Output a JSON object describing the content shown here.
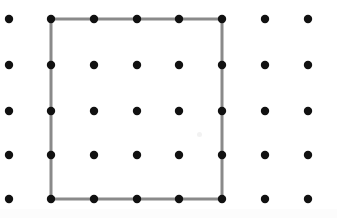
{
  "canvas": {
    "width": 337,
    "height": 218,
    "background": "#ffffff"
  },
  "grid": {
    "rows": 5,
    "columns": 8,
    "dot_color": "#111111",
    "dot_radius": 4.2,
    "column_x": [
      9,
      51,
      94,
      137,
      179,
      222,
      265,
      308
    ],
    "row_y": [
      19,
      65,
      111,
      155,
      199
    ],
    "points": [
      {
        "row": 0,
        "col": 0,
        "x": 9,
        "y": 19
      },
      {
        "row": 0,
        "col": 1,
        "x": 51,
        "y": 19
      },
      {
        "row": 0,
        "col": 2,
        "x": 94,
        "y": 19
      },
      {
        "row": 0,
        "col": 3,
        "x": 137,
        "y": 19
      },
      {
        "row": 0,
        "col": 4,
        "x": 179,
        "y": 19
      },
      {
        "row": 0,
        "col": 5,
        "x": 222,
        "y": 19
      },
      {
        "row": 0,
        "col": 6,
        "x": 265,
        "y": 19
      },
      {
        "row": 0,
        "col": 7,
        "x": 308,
        "y": 19
      },
      {
        "row": 1,
        "col": 0,
        "x": 9,
        "y": 65
      },
      {
        "row": 1,
        "col": 1,
        "x": 51,
        "y": 65
      },
      {
        "row": 1,
        "col": 2,
        "x": 94,
        "y": 65
      },
      {
        "row": 1,
        "col": 3,
        "x": 137,
        "y": 65
      },
      {
        "row": 1,
        "col": 4,
        "x": 179,
        "y": 65
      },
      {
        "row": 1,
        "col": 5,
        "x": 222,
        "y": 65
      },
      {
        "row": 1,
        "col": 6,
        "x": 265,
        "y": 65
      },
      {
        "row": 1,
        "col": 7,
        "x": 308,
        "y": 65
      },
      {
        "row": 2,
        "col": 0,
        "x": 9,
        "y": 111
      },
      {
        "row": 2,
        "col": 1,
        "x": 51,
        "y": 111
      },
      {
        "row": 2,
        "col": 2,
        "x": 94,
        "y": 111
      },
      {
        "row": 2,
        "col": 3,
        "x": 137,
        "y": 111
      },
      {
        "row": 2,
        "col": 4,
        "x": 179,
        "y": 111
      },
      {
        "row": 2,
        "col": 5,
        "x": 222,
        "y": 111
      },
      {
        "row": 2,
        "col": 6,
        "x": 265,
        "y": 111
      },
      {
        "row": 2,
        "col": 7,
        "x": 308,
        "y": 111
      },
      {
        "row": 3,
        "col": 0,
        "x": 9,
        "y": 155
      },
      {
        "row": 3,
        "col": 1,
        "x": 51,
        "y": 155
      },
      {
        "row": 3,
        "col": 2,
        "x": 94,
        "y": 155
      },
      {
        "row": 3,
        "col": 3,
        "x": 137,
        "y": 155
      },
      {
        "row": 3,
        "col": 4,
        "x": 179,
        "y": 155
      },
      {
        "row": 3,
        "col": 5,
        "x": 222,
        "y": 155
      },
      {
        "row": 3,
        "col": 6,
        "x": 265,
        "y": 155
      },
      {
        "row": 3,
        "col": 7,
        "x": 308,
        "y": 155
      },
      {
        "row": 4,
        "col": 0,
        "x": 9,
        "y": 199
      },
      {
        "row": 4,
        "col": 1,
        "x": 51,
        "y": 199
      },
      {
        "row": 4,
        "col": 2,
        "x": 94,
        "y": 199
      },
      {
        "row": 4,
        "col": 3,
        "x": 137,
        "y": 199
      },
      {
        "row": 4,
        "col": 4,
        "x": 179,
        "y": 199
      },
      {
        "row": 4,
        "col": 5,
        "x": 222,
        "y": 199
      },
      {
        "row": 4,
        "col": 6,
        "x": 265,
        "y": 199
      },
      {
        "row": 4,
        "col": 7,
        "x": 308,
        "y": 199
      }
    ]
  },
  "shape": {
    "kind": "square",
    "stroke_color": "#8a8a8a",
    "stroke_width": 3,
    "fill": "none",
    "corners": [
      {
        "name": "top-left",
        "x": 51,
        "y": 19,
        "row": 0,
        "col": 1
      },
      {
        "name": "top-right",
        "x": 222,
        "y": 19,
        "row": 0,
        "col": 5
      },
      {
        "name": "bottom-right",
        "x": 222,
        "y": 199,
        "row": 4,
        "col": 5
      },
      {
        "name": "bottom-left",
        "x": 51,
        "y": 199,
        "row": 4,
        "col": 1
      }
    ],
    "span_columns": 4,
    "span_rows": 4
  },
  "artifacts": [
    {
      "name": "center-smudge",
      "x": 199,
      "y": 134,
      "width": 5,
      "height": 5,
      "color": "#e8e8e8"
    }
  ]
}
